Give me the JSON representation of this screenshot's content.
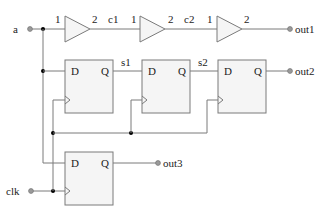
{
  "inputs": {
    "a": "a",
    "clk": "clk"
  },
  "outputs": {
    "out1": "out1",
    "out2": "out2",
    "out3": "out3"
  },
  "buffers": [
    {
      "in_pin": "1",
      "out_pin": "2"
    },
    {
      "in_pin": "1",
      "out_pin": "2"
    },
    {
      "in_pin": "1",
      "out_pin": "2"
    }
  ],
  "nets": {
    "c1": "c1",
    "c2": "c2",
    "s1": "s1",
    "s2": "s2"
  },
  "flipflops": [
    {
      "d": "D",
      "q": "Q"
    },
    {
      "d": "D",
      "q": "Q"
    },
    {
      "d": "D",
      "q": "Q"
    },
    {
      "d": "D",
      "q": "Q"
    }
  ],
  "colors": {
    "wire": "#7a7a7a",
    "fill": "#f5f5f5",
    "junction": "#000000"
  }
}
